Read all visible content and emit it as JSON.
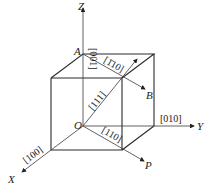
{
  "diagram": {
    "type": "cubic crystal directions",
    "axes": {
      "x": "X",
      "y": "Y",
      "z": "Z"
    },
    "points": {
      "origin": "O",
      "a": "A",
      "b": "B",
      "p": "P"
    },
    "directions": {
      "z_axis": "[001]",
      "y_axis": "[010]",
      "x_axis": "[100]",
      "body_diagonal": "[111]",
      "a_to_b": "[1̄10]",
      "o_to_p": "[110]"
    },
    "colors": {
      "line": "#2a2a2a",
      "text": "#222222",
      "background": "#ffffff"
    }
  }
}
